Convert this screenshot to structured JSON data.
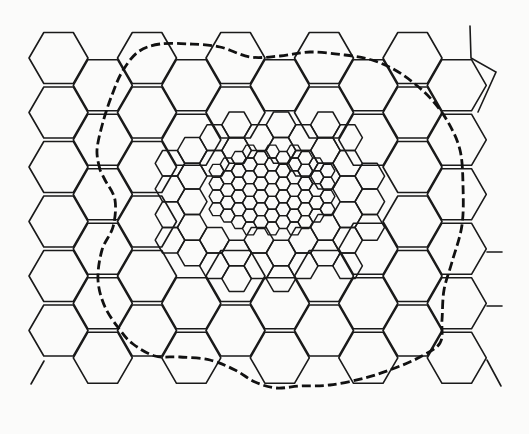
{
  "diagram": {
    "title": "",
    "colors": {
      "background": "#fbfbfa",
      "line": "#1a1a1a",
      "boundary": "#111111"
    },
    "tiers": [
      {
        "name": "macro-cells",
        "orientation": "flat-top",
        "side": 29.5,
        "origin_x": 58.5,
        "origin_y": 58,
        "col_step": 44.25,
        "row_step": 54.5,
        "cols": [
          0,
          1,
          2,
          3,
          4,
          5,
          6,
          7,
          8,
          9,
          10
        ],
        "rows": [
          0,
          1,
          2,
          3,
          4,
          5,
          6
        ],
        "exclude_inner_ellipse": {
          "cx": 272,
          "cy": 200,
          "rx": 108,
          "ry": 78
        }
      },
      {
        "name": "medium-cells",
        "orientation": "flat-top",
        "side": 14.8,
        "origin_x": 170,
        "origin_y": 112,
        "ring": {
          "cx": 272,
          "cy": 200,
          "rx_outer": 118,
          "ry_outer": 86,
          "rx_inner": 62,
          "ry_inner": 40
        }
      },
      {
        "name": "small-cells",
        "orientation": "flat-top",
        "side": 7.4,
        "region": {
          "cx": 272,
          "cy": 190,
          "rx": 66,
          "ry": 44
        }
      }
    ],
    "boundary": {
      "style": "dashed",
      "points": [
        [
          100,
          170
        ],
        [
          97,
          150
        ],
        [
          103,
          122
        ],
        [
          112,
          95
        ],
        [
          122,
          72
        ],
        [
          138,
          52
        ],
        [
          160,
          44
        ],
        [
          190,
          44
        ],
        [
          220,
          47
        ],
        [
          250,
          57
        ],
        [
          280,
          56
        ],
        [
          310,
          52
        ],
        [
          345,
          55
        ],
        [
          372,
          60
        ],
        [
          395,
          70
        ],
        [
          415,
          84
        ],
        [
          432,
          100
        ],
        [
          448,
          122
        ],
        [
          460,
          150
        ],
        [
          463,
          185
        ],
        [
          462,
          225
        ],
        [
          452,
          262
        ],
        [
          444,
          290
        ],
        [
          442,
          320
        ],
        [
          440,
          343
        ],
        [
          420,
          357
        ],
        [
          395,
          368
        ],
        [
          365,
          378
        ],
        [
          330,
          385
        ],
        [
          300,
          386
        ],
        [
          276,
          388
        ],
        [
          255,
          382
        ],
        [
          235,
          370
        ],
        [
          210,
          360
        ],
        [
          180,
          357
        ],
        [
          155,
          356
        ],
        [
          133,
          344
        ],
        [
          120,
          330
        ],
        [
          105,
          307
        ],
        [
          98,
          280
        ],
        [
          102,
          250
        ],
        [
          113,
          227
        ],
        [
          115,
          200
        ],
        [
          105,
          180
        ],
        [
          100,
          170
        ]
      ]
    },
    "edge_stubs": [
      {
        "name": "top-right-stub",
        "points": [
          [
            470,
            26
          ],
          [
            471,
            58
          ],
          [
            496,
            72
          ],
          [
            478,
            112
          ]
        ]
      },
      {
        "name": "right-stub-1",
        "points": [
          [
            487,
            252
          ],
          [
            502,
            252
          ]
        ]
      },
      {
        "name": "right-stub-2",
        "points": [
          [
            487,
            306
          ],
          [
            502,
            306
          ]
        ]
      },
      {
        "name": "bottom-right-stub",
        "points": [
          [
            487,
            360
          ],
          [
            501,
            386
          ]
        ]
      },
      {
        "name": "bottom-left-stub",
        "points": [
          [
            44,
            361
          ],
          [
            31,
            384
          ]
        ]
      }
    ]
  }
}
